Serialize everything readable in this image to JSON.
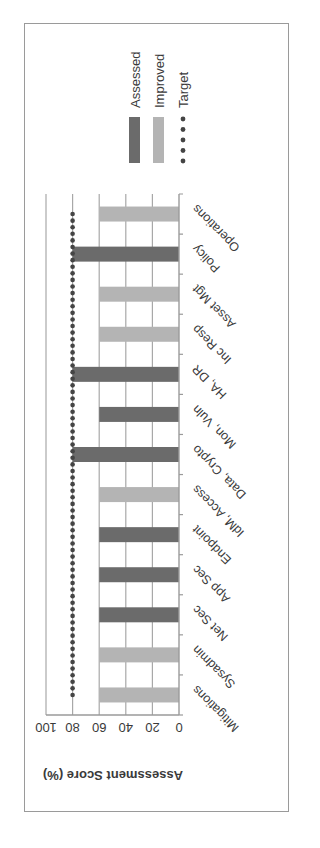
{
  "chart_data": {
    "type": "bar",
    "title": "",
    "xlabel": "",
    "ylabel": "Assessment Score (%)",
    "ylim": [
      0,
      100
    ],
    "yticks": [
      0,
      20,
      40,
      60,
      80,
      100
    ],
    "grid": true,
    "orientation_note": "figure rotated 90 degrees counter-clockwise on the page",
    "legend_position": "right",
    "categories": [
      "Mitigations",
      "Sysadmin",
      "Net Sec",
      "App Sec",
      "Endpoint",
      "IdM, Access",
      "Data, Crypto",
      "Mon, Vuln",
      "HA, DR",
      "Inc Resp",
      "Asset Mgt",
      "Policy",
      "Operations"
    ],
    "series": [
      {
        "name": "Assessed",
        "color": "#6b6b6b",
        "values": [
          null,
          null,
          60,
          60,
          60,
          null,
          80,
          60,
          80,
          null,
          null,
          80,
          null
        ]
      },
      {
        "name": "Improved",
        "color": "#b4b4b4",
        "values": [
          60,
          60,
          null,
          null,
          null,
          60,
          null,
          null,
          null,
          60,
          60,
          null,
          60
        ]
      },
      {
        "name": "Target",
        "color": "#444444",
        "style": "dotted-line",
        "values": [
          80,
          80,
          80,
          80,
          80,
          80,
          80,
          80,
          80,
          80,
          80,
          80,
          80
        ]
      }
    ]
  },
  "legend": {
    "items": [
      {
        "label": "Assessed",
        "color": "#6b6b6b",
        "kind": "bar"
      },
      {
        "label": "Improved",
        "color": "#b4b4b4",
        "kind": "bar"
      },
      {
        "label": "Target",
        "color": "#444444",
        "kind": "dots"
      }
    ]
  },
  "axis": {
    "y_title": "Assessment Score (%)",
    "y_ticks": [
      "0",
      "20",
      "40",
      "60",
      "80",
      "100"
    ]
  }
}
